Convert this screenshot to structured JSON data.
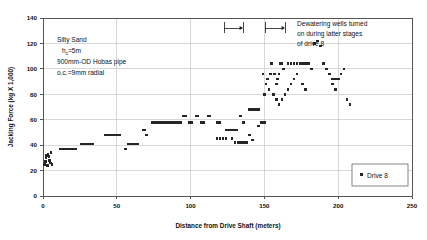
{
  "chart_data": {
    "type": "scatter",
    "title": "",
    "xlabel": "Distance from Drive Shaft (meters)",
    "ylabel": "Jacking Force (kg X 1,000)",
    "xlim": [
      0,
      250
    ],
    "ylim": [
      0,
      140
    ],
    "xticks": [
      0,
      50,
      100,
      150,
      200,
      250
    ],
    "yticks": [
      0,
      20,
      40,
      60,
      80,
      100,
      120,
      140
    ],
    "grid": true,
    "legend_position": "bottom-right",
    "series": [
      {
        "name": "Drive 8",
        "marker": "square",
        "color": "#262626",
        "points": [
          [
            1,
            25
          ],
          [
            1.5,
            27
          ],
          [
            2,
            30
          ],
          [
            2.5,
            32
          ],
          [
            3,
            24
          ],
          [
            3.5,
            33
          ],
          [
            4,
            31
          ],
          [
            4.5,
            28
          ],
          [
            5,
            26
          ],
          [
            5.5,
            34
          ],
          [
            6,
            25
          ],
          [
            12,
            37
          ],
          [
            13,
            37
          ],
          [
            14,
            37
          ],
          [
            15,
            37
          ],
          [
            16,
            37
          ],
          [
            17,
            37
          ],
          [
            18,
            37
          ],
          [
            19,
            37
          ],
          [
            20,
            37
          ],
          [
            21,
            37
          ],
          [
            22,
            37
          ],
          [
            26,
            41
          ],
          [
            27,
            41
          ],
          [
            28,
            41
          ],
          [
            29,
            41
          ],
          [
            30,
            41
          ],
          [
            31,
            41
          ],
          [
            32,
            41
          ],
          [
            33,
            41
          ],
          [
            34,
            41
          ],
          [
            42,
            48
          ],
          [
            43,
            48
          ],
          [
            44,
            48
          ],
          [
            45,
            48
          ],
          [
            46,
            48
          ],
          [
            47,
            48
          ],
          [
            48,
            48
          ],
          [
            49,
            48
          ],
          [
            50,
            48
          ],
          [
            51,
            48
          ],
          [
            52,
            48
          ],
          [
            56,
            37
          ],
          [
            58,
            41
          ],
          [
            59,
            41
          ],
          [
            60,
            41
          ],
          [
            61,
            41
          ],
          [
            62,
            41
          ],
          [
            63,
            41
          ],
          [
            64,
            41
          ],
          [
            68,
            52
          ],
          [
            69,
            52
          ],
          [
            70,
            48
          ],
          [
            74,
            58
          ],
          [
            75,
            58
          ],
          [
            76,
            58
          ],
          [
            77,
            58
          ],
          [
            78,
            58
          ],
          [
            79,
            58
          ],
          [
            80,
            58
          ],
          [
            81,
            58
          ],
          [
            82,
            58
          ],
          [
            83,
            58
          ],
          [
            84,
            58
          ],
          [
            85,
            58
          ],
          [
            86,
            58
          ],
          [
            87,
            58
          ],
          [
            88,
            58
          ],
          [
            89,
            58
          ],
          [
            90,
            58
          ],
          [
            91,
            58
          ],
          [
            92,
            58
          ],
          [
            93,
            58
          ],
          [
            95,
            63
          ],
          [
            97,
            63
          ],
          [
            99,
            58
          ],
          [
            100,
            58
          ],
          [
            101,
            58
          ],
          [
            104,
            63
          ],
          [
            105,
            63
          ],
          [
            107,
            58
          ],
          [
            108,
            58
          ],
          [
            109,
            58
          ],
          [
            112,
            63
          ],
          [
            113,
            63
          ],
          [
            118,
            58
          ],
          [
            119,
            58
          ],
          [
            120,
            58
          ],
          [
            124,
            52
          ],
          [
            125,
            52
          ],
          [
            126,
            52
          ],
          [
            127,
            52
          ],
          [
            128,
            52
          ],
          [
            129,
            52
          ],
          [
            130,
            52
          ],
          [
            131,
            52
          ],
          [
            134,
            63
          ],
          [
            136,
            58
          ],
          [
            140,
            68
          ],
          [
            141,
            68
          ],
          [
            142,
            68
          ],
          [
            143,
            68
          ],
          [
            144,
            68
          ],
          [
            145,
            68
          ],
          [
            146,
            68
          ],
          [
            148,
            58
          ],
          [
            150,
            58
          ],
          [
            118,
            45
          ],
          [
            120,
            45
          ],
          [
            122,
            45
          ],
          [
            124,
            45
          ],
          [
            128,
            45
          ],
          [
            130,
            42
          ],
          [
            132,
            42
          ],
          [
            134,
            42
          ],
          [
            136,
            42
          ],
          [
            138,
            42
          ],
          [
            140,
            48
          ],
          [
            142,
            44
          ],
          [
            146,
            55
          ],
          [
            150,
            80
          ],
          [
            152,
            92
          ],
          [
            154,
            96
          ],
          [
            155,
            104
          ],
          [
            157,
            96
          ],
          [
            158,
            88
          ],
          [
            159,
            92
          ],
          [
            160,
            96
          ],
          [
            161,
            104
          ],
          [
            162,
            104
          ],
          [
            163,
            100
          ],
          [
            149,
            96
          ],
          [
            151,
            88
          ],
          [
            153,
            84
          ],
          [
            156,
            80
          ],
          [
            158,
            76
          ],
          [
            160,
            72
          ],
          [
            162,
            76
          ],
          [
            164,
            80
          ],
          [
            166,
            84
          ],
          [
            168,
            88
          ],
          [
            170,
            92
          ],
          [
            172,
            96
          ],
          [
            166,
            104
          ],
          [
            168,
            104
          ],
          [
            170,
            104
          ],
          [
            172,
            104
          ],
          [
            174,
            104
          ],
          [
            176,
            104
          ],
          [
            178,
            104
          ],
          [
            180,
            104
          ],
          [
            182,
            100
          ],
          [
            176,
            88
          ],
          [
            178,
            84
          ],
          [
            184,
            120
          ],
          [
            186,
            122
          ],
          [
            188,
            118
          ],
          [
            190,
            104
          ],
          [
            192,
            100
          ],
          [
            194,
            96
          ],
          [
            196,
            92
          ],
          [
            198,
            92
          ],
          [
            200,
            92
          ],
          [
            202,
            96
          ],
          [
            204,
            100
          ],
          [
            196,
            88
          ],
          [
            198,
            84
          ],
          [
            206,
            76
          ],
          [
            208,
            72
          ]
        ]
      }
    ],
    "annotations": [
      {
        "id": "material-note",
        "lines": [
          "Silty Sand",
          "h_c=5m",
          "900mm-OD Hobas pipe",
          "o.c.=9mm radial"
        ],
        "line1": "Silty Sand",
        "line2_pre": "h",
        "line2_sub": "c",
        "line2_post": "=5m",
        "line3": "900mm-OD Hobas pipe",
        "line4": "o.c.=9mm radial"
      },
      {
        "id": "dewatering-note",
        "line1": "Dewatering wells turned",
        "line2": "on during latter stages",
        "line3": "of drive 8"
      }
    ]
  },
  "legend": {
    "entries": [
      {
        "label": "Drive 8"
      }
    ]
  }
}
